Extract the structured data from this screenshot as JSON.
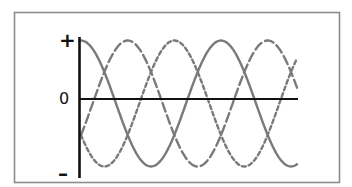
{
  "diagram": {
    "axis_labels": {
      "positive": "+",
      "zero": "0",
      "negative": "–"
    },
    "colors": {
      "frame": "#8c8c8c",
      "axis": "#111111",
      "wave": "#7a7a7a"
    }
  },
  "chart_data": {
    "type": "line",
    "title": "",
    "xlabel": "",
    "ylabel": "",
    "y_tick_labels": [
      "+",
      "0",
      "–"
    ],
    "ylim": [
      -1,
      1
    ],
    "grid": false,
    "legend": null,
    "x_range_cycles": [
      0,
      1.55
    ],
    "series": [
      {
        "name": "phase-1",
        "style": "solid",
        "phase_deg": 0,
        "amplitude": 1,
        "formula": "cos(2*pi*t)"
      },
      {
        "name": "phase-2",
        "style": "long-dash",
        "phase_deg": -120,
        "amplitude": 1,
        "formula": "cos(2*pi*t - 2*pi/3)"
      },
      {
        "name": "phase-3",
        "style": "short-dash",
        "phase_deg": -240,
        "amplitude": 1,
        "formula": "cos(2*pi*t - 4*pi/3)"
      }
    ]
  }
}
